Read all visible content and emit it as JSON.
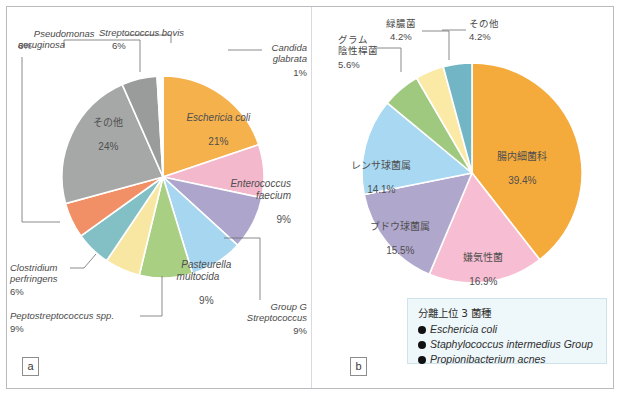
{
  "figure": {
    "panel_a_tag": "a",
    "panel_b_tag": "b"
  },
  "chart_data": [
    {
      "type": "pie",
      "panel": "a",
      "title": "",
      "legend_position": "callout-labels",
      "center": [
        163,
        177
      ],
      "radius": 101,
      "start_angle_deg": -90,
      "categories": [
        "Escherichia coli",
        "Enterococcus faecium",
        "Group G Streptococcus",
        "Pasteurella multocida",
        "Peptostreptococcus spp.",
        "Clostridium perfringens",
        "unlabeled-teal",
        "Pseudomonas aeruginosa",
        "その他",
        "Streptococcus bovis",
        "Candida glabrata"
      ],
      "values": [
        21,
        9,
        9,
        9,
        9,
        6,
        6,
        6,
        24,
        6,
        1
      ],
      "colors": [
        "#f5b14c",
        "#f3b8cb",
        "#aea5cc",
        "#a6d6f0",
        "#a9cf83",
        "#f8e7a3",
        "#83c0c6",
        "#f18f66",
        "#a6a8a8",
        "#9a9c9c",
        "#ffffff"
      ],
      "labels": [
        {
          "name": "Escherichia coli",
          "pct": "21%",
          "italic": true,
          "placement": "inside"
        },
        {
          "name": "Enterococcus\nfaecium",
          "pct": "9%",
          "italic": true,
          "placement": "inside"
        },
        {
          "name": "Group G\nStreptococcus",
          "pct": "9%",
          "italic": true,
          "placement": "outside"
        },
        {
          "name": "Pasteurella\nmultocida",
          "pct": "9%",
          "italic": true,
          "placement": "inside"
        },
        {
          "name": "Peptostreptococcus spp.",
          "pct": "9%",
          "italic": true,
          "placement": "outside"
        },
        {
          "name": "Clostridium\nperfringens",
          "pct": "6%",
          "italic": true,
          "placement": "outside"
        },
        {
          "name": "Pseudomonas\naeruginosa",
          "pct": "6%",
          "italic": true,
          "placement": "outside"
        },
        {
          "name": "その他",
          "pct": "24%",
          "italic": false,
          "placement": "inside"
        },
        {
          "name": "Streptococcus bovis",
          "pct": "6%",
          "italic": true,
          "placement": "outside"
        },
        {
          "name": "Candida\nglabrata",
          "pct": "1%",
          "italic": true,
          "placement": "outside"
        }
      ]
    },
    {
      "type": "pie",
      "panel": "b",
      "title": "",
      "legend_position": "bottom-right-box",
      "center": [
        472,
        173
      ],
      "radius": 110,
      "start_angle_deg": -90,
      "categories": [
        "腸内細菌科",
        "嫌気性菌",
        "ブドウ球菌属",
        "レンサ球菌属",
        "グラム陰性桿菌",
        "緑膿菌",
        "その他"
      ],
      "values": [
        39.4,
        16.9,
        15.5,
        14.1,
        5.6,
        4.2,
        4.2
      ],
      "colors": [
        "#f5ab3c",
        "#f7bdd2",
        "#b0a7cc",
        "#a8d8f2",
        "#9ec97f",
        "#fbe9a6",
        "#72b6c6"
      ],
      "labels": [
        {
          "name": "腸内細菌科",
          "pct": "39.4%",
          "placement": "inside"
        },
        {
          "name": "嫌気性菌",
          "pct": "16.9%",
          "placement": "inside"
        },
        {
          "name": "ブドウ球菌属",
          "pct": "15.5%",
          "placement": "inside"
        },
        {
          "name": "レンサ球菌属",
          "pct": "14.1%",
          "placement": "inside"
        },
        {
          "name": "グラム\n陰性桿菌",
          "pct": "5.6%",
          "placement": "outside"
        },
        {
          "name": "緑膿菌",
          "pct": "4.2%",
          "placement": "outside"
        },
        {
          "name": "その他",
          "pct": "4.2%",
          "placement": "outside"
        }
      ]
    }
  ],
  "panel_b_legend": {
    "title": "分離上位 3 菌種",
    "items": [
      "Eschericia coli",
      "Staphylococcus intermedius Group",
      "Propionibacterium acnes"
    ]
  },
  "panel_a_labels": {
    "pseudomonas": "Pseudomonas\naeruginosa",
    "pseudomonas_pct": "6%",
    "strep_bovis": "Streptococcus bovis",
    "strep_bovis_pct": "6%",
    "candida": "Candida\nglabrata",
    "candida_pct": "1%",
    "ecoli": "Eschericia coli",
    "ecoli_pct": "21%",
    "entero": "Enterococcus\nfaecium",
    "entero_pct": "9%",
    "groupg": "Group G\nStreptococcus",
    "groupg_pct": "9%",
    "pasteurella": "Pasteurella\nmultocida",
    "pasteurella_pct": "9%",
    "pepto": "Peptostreptococcus spp.",
    "pepto_pct": "9%",
    "clostridium": "Clostridium\nperfringens",
    "clostridium_pct": "6%",
    "other": "その他",
    "other_pct": "24%"
  },
  "panel_b_labels": {
    "ryokunou": "緑膿菌",
    "ryokunou_pct": "4.2%",
    "gram": "グラム\n陰性桿菌",
    "gram_pct": "5.6%",
    "sonota": "その他",
    "sonota_pct": "4.2%",
    "renza": "レンサ球菌属",
    "renza_pct": "14.1%",
    "budou": "ブドウ球菌属",
    "budou_pct": "15.5%",
    "kenki": "嫌気性菌",
    "kenki_pct": "16.9%",
    "chounai": "腸内細菌科",
    "chounai_pct": "39.4%"
  }
}
